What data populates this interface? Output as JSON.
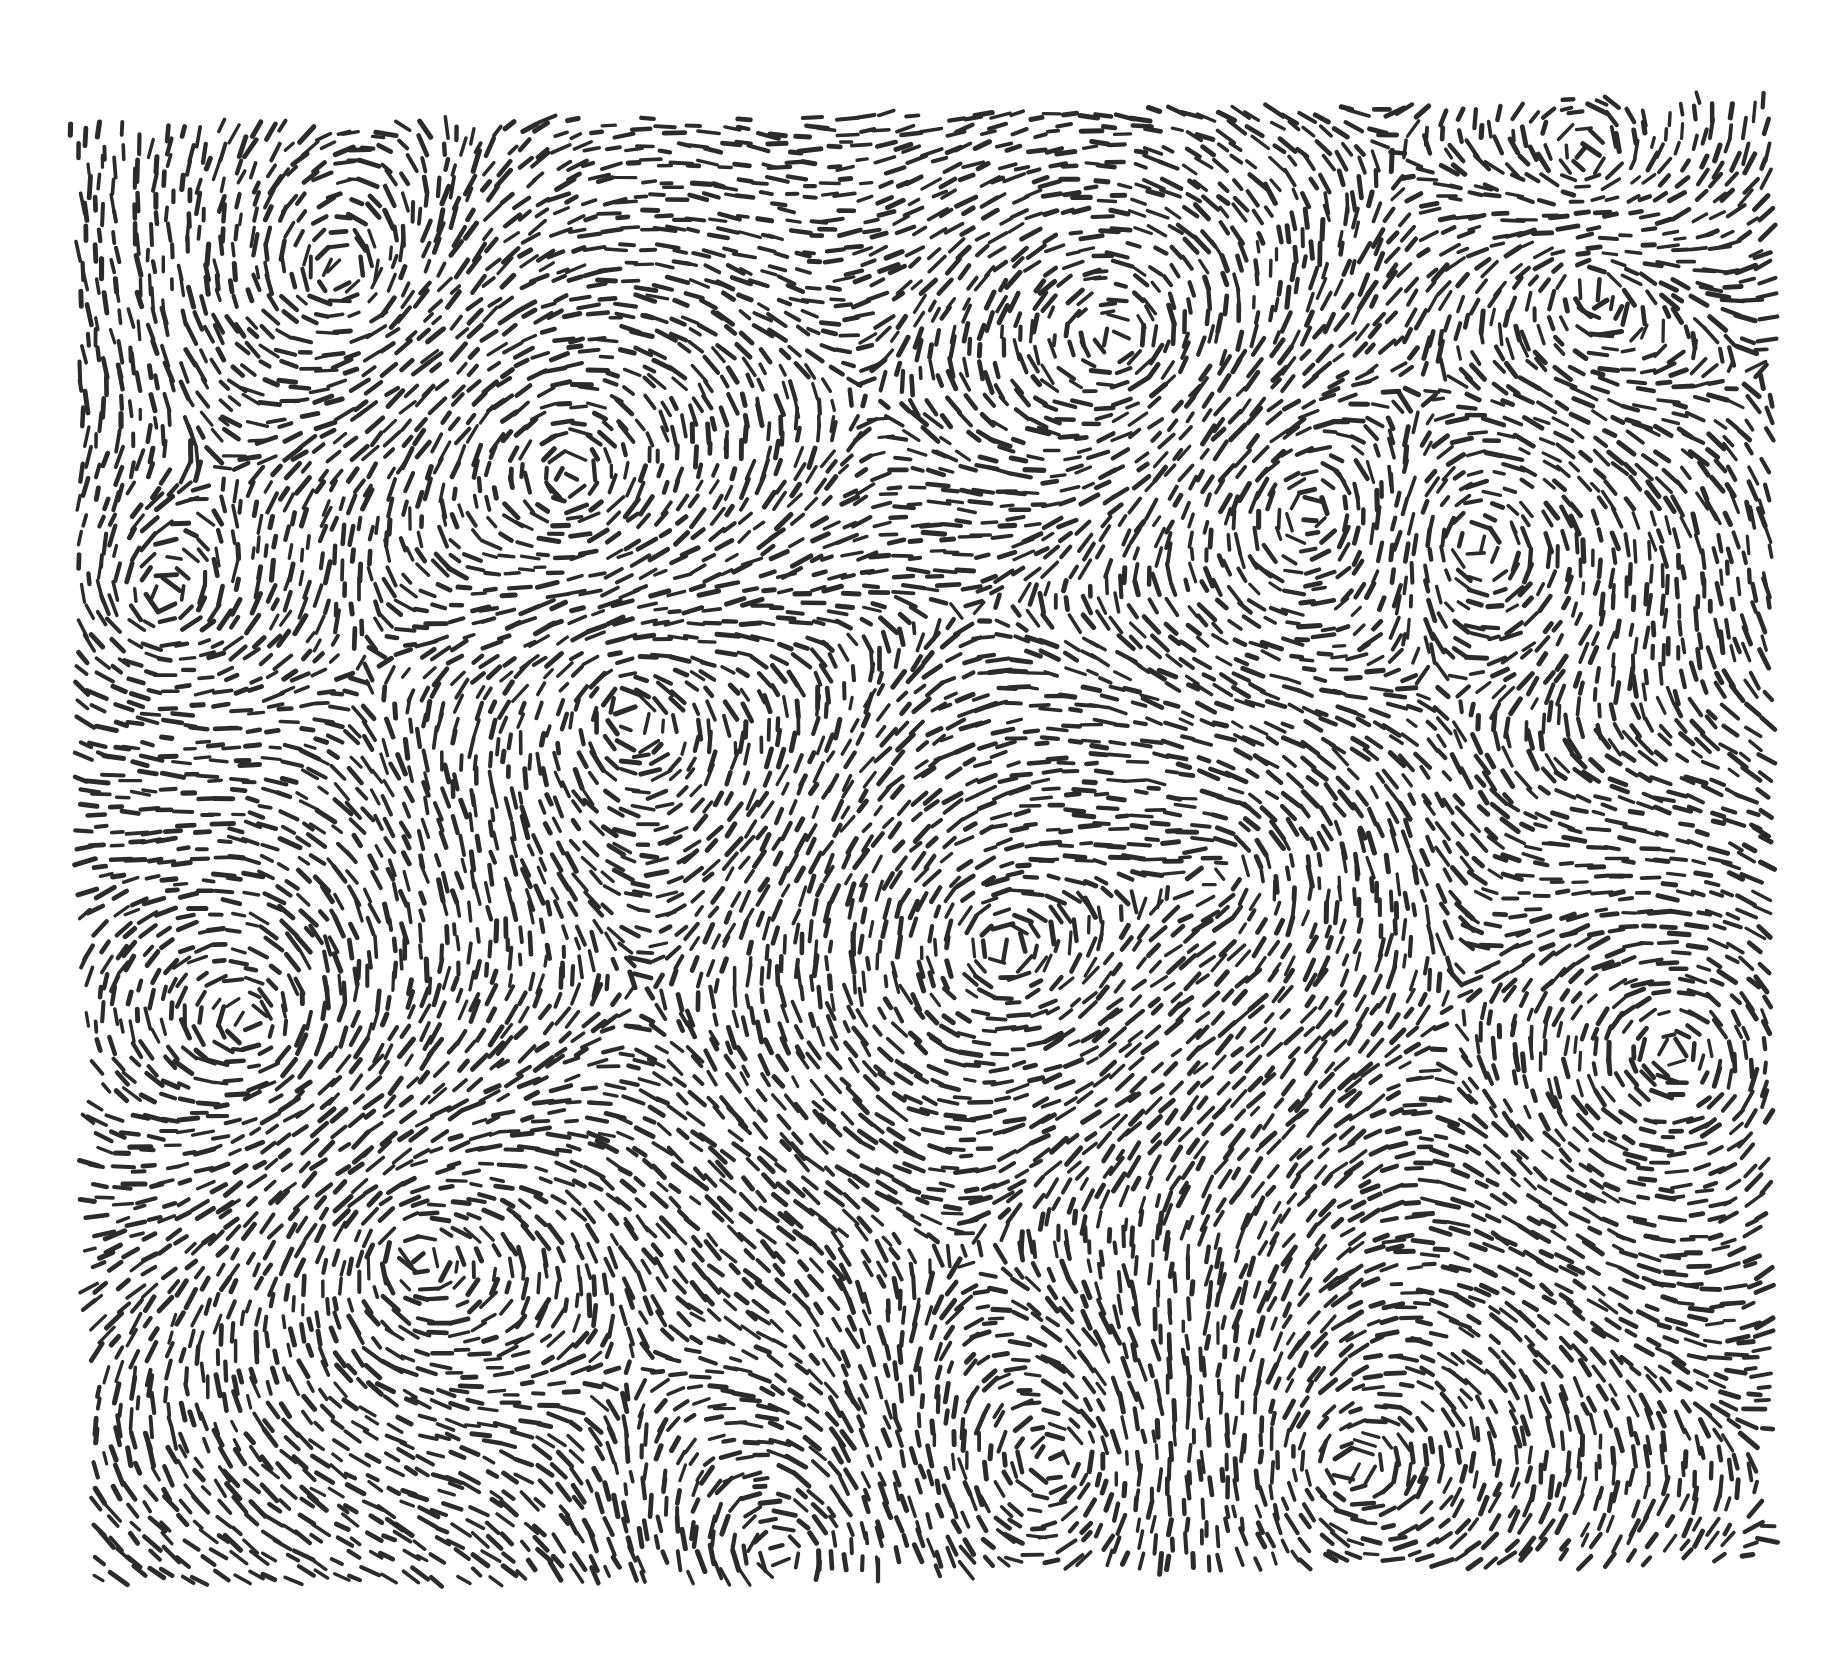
{
  "artwork": {
    "title": "Flow-field ink drawing of short dashes swirling around multiple vortices",
    "canvas": {
      "width": 1842,
      "height": 1675,
      "background": "#ffffff"
    },
    "ink_color": "#2b2b2b",
    "region": {
      "top_left": [
        70,
        128
      ],
      "top_right": [
        1772,
        95
      ],
      "bottom_right": [
        1768,
        1560
      ],
      "bottom_left": [
        92,
        1588
      ]
    },
    "stroke": {
      "length_min": 10,
      "length_max": 22,
      "width_min": 3.2,
      "width_max": 5.2,
      "spacing": 17,
      "jitter": 6
    },
    "background_flow_angle_deg": 72,
    "vortices": [
      {
        "x": 1590,
        "y": 165,
        "strength": 1.0,
        "radius": 150
      },
      {
        "x": 1590,
        "y": 280,
        "strength": -0.9,
        "radius": 140
      },
      {
        "x": 1120,
        "y": 340,
        "strength": 1.0,
        "radius": 200
      },
      {
        "x": 1310,
        "y": 510,
        "strength": -0.9,
        "radius": 170
      },
      {
        "x": 1470,
        "y": 540,
        "strength": 0.8,
        "radius": 160
      },
      {
        "x": 570,
        "y": 480,
        "strength": 1.0,
        "radius": 230
      },
      {
        "x": 340,
        "y": 280,
        "strength": -0.8,
        "radius": 200
      },
      {
        "x": 620,
        "y": 700,
        "strength": -0.8,
        "radius": 200
      },
      {
        "x": 1000,
        "y": 950,
        "strength": 0.9,
        "radius": 230
      },
      {
        "x": 255,
        "y": 1030,
        "strength": 1.0,
        "radius": 200
      },
      {
        "x": 410,
        "y": 1250,
        "strength": -0.9,
        "radius": 200
      },
      {
        "x": 1675,
        "y": 1050,
        "strength": 1.0,
        "radius": 180
      },
      {
        "x": 1340,
        "y": 1470,
        "strength": -0.9,
        "radius": 200
      },
      {
        "x": 1060,
        "y": 1460,
        "strength": 0.9,
        "radius": 200
      },
      {
        "x": 780,
        "y": 1560,
        "strength": -0.8,
        "radius": 180
      },
      {
        "x": 1230,
        "y": 870,
        "strength": 0.8,
        "radius": 190
      },
      {
        "x": 160,
        "y": 600,
        "strength": -0.7,
        "radius": 170
      }
    ]
  }
}
